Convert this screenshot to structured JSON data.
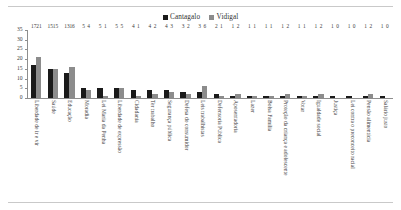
{
  "legend": {
    "items": [
      {
        "label": "Cantagalo",
        "color": "#1a1a1a",
        "swatch_icon": "square-marker-icon"
      },
      {
        "label": "Vidigal",
        "color": "#8c8c8c",
        "swatch_icon": "square-marker-icon"
      }
    ]
  },
  "axis": {
    "y_ticks": [
      "0",
      "5",
      "10",
      "15",
      "20",
      "25",
      "30",
      "35"
    ]
  },
  "chart_data": {
    "type": "bar",
    "title": "",
    "subtitle": "",
    "xlabel": "",
    "ylabel": "",
    "ylim": [
      0,
      35
    ],
    "grid": false,
    "legend_position": "top-center",
    "orientation": "vertical",
    "grouping": "grouped",
    "categories": [
      "Liberdade de ir e vir",
      "Saúde",
      "Educação",
      "Moradia",
      "Lei Maria da Penha",
      "Liberdade de expressão",
      "Cidadania",
      "Ter trabalho",
      "Segurança pública",
      "Defesa do consumidor",
      "Leis trabalhistas",
      "Defensoria Pública",
      "Aposentadoria",
      "Lazer",
      "Bolsa Família",
      "Proteção da criança e adolescente",
      "Votar",
      "Igualdade social",
      "Justiça",
      "Lei contra o preconceito racial",
      "Pensão alimentícia",
      "Salário justo"
    ],
    "series": [
      {
        "name": "Cantagalo",
        "color": "#1a1a1a",
        "values": [
          17,
          15,
          13,
          5,
          5,
          5,
          4,
          4,
          4,
          3,
          3,
          2,
          1,
          1,
          1,
          1,
          1,
          1,
          1,
          1,
          1,
          1
        ]
      },
      {
        "name": "Vidigal",
        "color": "#8c8c8c",
        "values": [
          21,
          15,
          16,
          4,
          1,
          5,
          1,
          2,
          3,
          2,
          6,
          1,
          2,
          1,
          1,
          2,
          1,
          2,
          0,
          0,
          2,
          0
        ]
      }
    ]
  }
}
